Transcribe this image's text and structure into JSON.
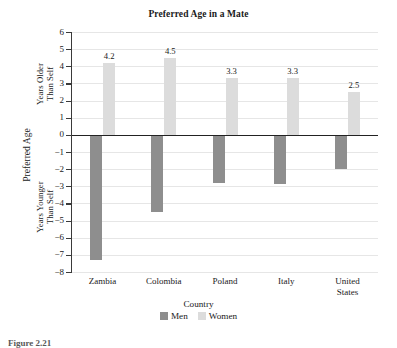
{
  "figure": {
    "caption": "Figure 2.21"
  },
  "chart_data": {
    "type": "bar",
    "title": "Preferred Age in a Mate",
    "xlabel": "Country",
    "ylabel": "Preferred Age",
    "ylabel_upper": "Years Older Than Self",
    "ylabel_upper_line1": "Years Older",
    "ylabel_upper_line2": "Than Self",
    "ylabel_lower": "Years Younger Than Self",
    "ylabel_lower_line1": "Years Younger",
    "ylabel_lower_line2": "Than Self",
    "categories": [
      "Zambia",
      "Colombia",
      "Poland",
      "Italy",
      "United States"
    ],
    "category_lines": [
      [
        "Zambia"
      ],
      [
        "Colombia"
      ],
      [
        "Poland"
      ],
      [
        "Italy"
      ],
      [
        "United",
        "States"
      ]
    ],
    "series": [
      {
        "name": "Men",
        "color": "#8e8e8e",
        "values": [
          -7.3,
          -4.5,
          -2.8,
          -2.85,
          -2.0
        ],
        "labels": [
          "",
          "",
          "",
          "",
          ""
        ]
      },
      {
        "name": "Women",
        "color": "#dcdcdc",
        "values": [
          4.2,
          4.5,
          3.3,
          3.3,
          2.5
        ],
        "labels": [
          "4.2",
          "4.5",
          "3.3",
          "3.3",
          "2.5"
        ]
      }
    ],
    "ylim": [
      -8,
      6
    ],
    "ytick_values": [
      6,
      5,
      4,
      3,
      2,
      1,
      0,
      -1,
      -2,
      -3,
      -4,
      -5,
      -6,
      -7,
      -8
    ],
    "ytick_labels": [
      "6",
      "5",
      "4",
      "3",
      "2",
      "1",
      "0",
      "−1",
      "−2",
      "−3",
      "−4",
      "−5",
      "−6",
      "−7",
      "−8"
    ],
    "grid": true,
    "legend_position": "bottom",
    "legend_entries": [
      "Men",
      "Women"
    ]
  }
}
